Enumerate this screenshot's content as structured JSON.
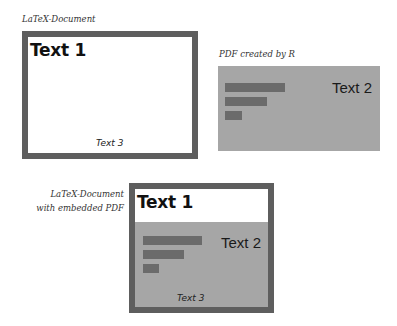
{
  "diagram": {
    "top_left": {
      "caption": "LaTeX-Document",
      "text1": "Text 1",
      "text3": "Text 3"
    },
    "top_right": {
      "caption": "PDF created by R",
      "text2": "Text 2",
      "bars": [
        {
          "label": "bar-1",
          "relative_length": 60
        },
        {
          "label": "bar-2",
          "relative_length": 42
        },
        {
          "label": "bar-3",
          "relative_length": 17
        }
      ]
    },
    "bottom": {
      "caption_line1": "LaTeX-Document",
      "caption_line2": "with embedded PDF",
      "text1": "Text 1",
      "text2": "Text 2",
      "text3": "Text 3",
      "bars": [
        {
          "label": "bar-1",
          "relative_length": 59
        },
        {
          "label": "bar-2",
          "relative_length": 41
        },
        {
          "label": "bar-3",
          "relative_length": 16
        }
      ]
    },
    "colors": {
      "frame": "#5e5e5e",
      "pdf_background": "#a6a6a6",
      "bar": "#6b6b6b",
      "page": "#ffffff"
    }
  }
}
